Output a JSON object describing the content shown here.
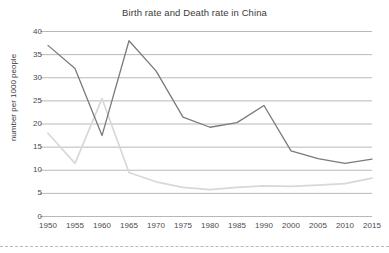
{
  "chart_data": {
    "type": "line",
    "title": "Birth rate and Death rate in China",
    "xlabel": "",
    "ylabel": "number per 1000 people",
    "ylim": [
      0,
      40
    ],
    "ytick_step": 5,
    "grid": true,
    "grid_axis": "y",
    "legend": "none",
    "categories": [
      "1950",
      "1955",
      "1960",
      "1965",
      "1970",
      "1975",
      "1980",
      "1985",
      "1990",
      "2000",
      "2005",
      "2010",
      "2015"
    ],
    "x": [
      1950,
      1955,
      1960,
      1965,
      1970,
      1975,
      1980,
      1985,
      1990,
      2000,
      2005,
      2010,
      2015
    ],
    "ytick_labels": [
      "0",
      "5",
      "10",
      "15",
      "20",
      "25",
      "30",
      "35",
      "40"
    ],
    "ytick_values": [
      0,
      5,
      10,
      15,
      20,
      25,
      30,
      35,
      40
    ],
    "series": [
      {
        "name": "Birth rate",
        "color": "#7a7a7a",
        "values": [
          37.0,
          32.0,
          17.5,
          38.0,
          31.5,
          21.5,
          19.3,
          20.3,
          24.0,
          14.2,
          12.5,
          11.5,
          12.4
        ]
      },
      {
        "name": "Death rate",
        "color": "#d8d8d8",
        "values": [
          18.0,
          11.5,
          25.5,
          9.5,
          7.5,
          6.3,
          5.8,
          6.3,
          6.6,
          6.5,
          6.8,
          7.1,
          8.3
        ]
      }
    ],
    "annotations": []
  },
  "style": {
    "gridline_color": "#b0b0b0",
    "axis_text_color": "#4a4a4a",
    "title_color": "#3b3b3b",
    "background": "#ffffff",
    "divider_color": "#b9b9b9"
  }
}
